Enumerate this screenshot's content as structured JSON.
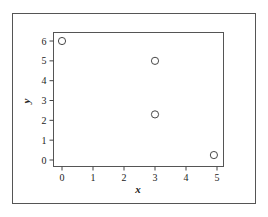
{
  "chart_data": {
    "type": "scatter",
    "title": "",
    "xlabel": "x",
    "ylabel": "y",
    "xlim": [
      -0.25,
      5.25
    ],
    "ylim": [
      -0.3,
      6.3
    ],
    "xticks": [
      0,
      1,
      2,
      3,
      4,
      5
    ],
    "yticks": [
      0,
      1,
      2,
      3,
      4,
      5,
      6
    ],
    "grid": false,
    "legend": null,
    "series": [
      {
        "name": "points",
        "marker": "open-circle",
        "points": [
          {
            "x": 0,
            "y": 6
          },
          {
            "x": 3,
            "y": 5
          },
          {
            "x": 3,
            "y": 2.3
          },
          {
            "x": 4.9,
            "y": 0.25
          }
        ]
      }
    ]
  },
  "colors": {
    "frame": "#555555",
    "axis": "#444444",
    "marker": "#333333",
    "background": "#ffffff"
  }
}
